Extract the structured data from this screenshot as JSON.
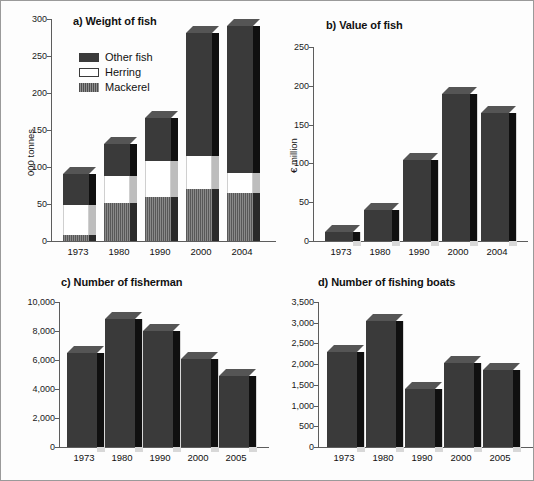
{
  "figure": {
    "background": "#fdfdfd",
    "border_color": "#9a9a9a"
  },
  "legend": {
    "items": [
      {
        "label": "Other fish",
        "swatch": "dark",
        "color": "#3a3a3a"
      },
      {
        "label": "Herring",
        "swatch": "white",
        "color": "#ffffff"
      },
      {
        "label": "Mackerel",
        "swatch": "hatch",
        "color": "#6e6e6e"
      }
    ]
  },
  "panels": {
    "a": {
      "title": "a) Weight of fish",
      "ylabel": "000 tonnes",
      "yticks": [
        "300",
        "250",
        "200",
        "150",
        "100",
        "50",
        "0"
      ],
      "xticks": [
        "1973",
        "1980",
        "1990",
        "2000",
        "2004"
      ]
    },
    "b": {
      "title": "b) Value of fish",
      "ylabel": "€ million",
      "yticks": [
        "250",
        "200",
        "150",
        "100",
        "50",
        "0"
      ],
      "xticks": [
        "1973",
        "1980",
        "1990",
        "2000",
        "2004"
      ]
    },
    "c": {
      "title": "c) Number of fisherman",
      "ylabel": "",
      "yticks": [
        "10,000",
        "8,000",
        "6,000",
        "4,000",
        "2,000",
        "0"
      ],
      "xticks": [
        "1973",
        "1980",
        "1990",
        "2000",
        "2005"
      ]
    },
    "d": {
      "title": "d) Number of fishing boats",
      "ylabel": "",
      "yticks": [
        "3,500",
        "3,000",
        "2,500",
        "2,000",
        "1,500",
        "1,000",
        "500",
        "0"
      ],
      "xticks": [
        "1973",
        "1980",
        "1990",
        "2000",
        "2005"
      ]
    }
  },
  "chart_data": [
    {
      "id": "a",
      "type": "bar",
      "stacked": true,
      "title": "a) Weight of fish",
      "xlabel": "",
      "ylabel": "000 tonnes",
      "ylim": [
        0,
        300
      ],
      "ytick_values": [
        0,
        50,
        100,
        150,
        200,
        250,
        300
      ],
      "grid": false,
      "legend_position": "inside-top-left",
      "categories": [
        "1973",
        "1980",
        "1990",
        "2000",
        "2004"
      ],
      "series": [
        {
          "name": "Mackerel",
          "values": [
            8,
            51,
            60,
            71,
            65
          ],
          "color": "#6e6e6e"
        },
        {
          "name": "Herring",
          "values": [
            40,
            37,
            48,
            44,
            27
          ],
          "color": "#ffffff"
        },
        {
          "name": "Other fish",
          "values": [
            42,
            43,
            58,
            166,
            198
          ],
          "color": "#3a3a3a"
        }
      ],
      "totals": [
        90,
        131,
        166,
        281,
        290
      ]
    },
    {
      "id": "b",
      "type": "bar",
      "stacked": false,
      "title": "b) Value of fish",
      "xlabel": "",
      "ylabel": "€ million",
      "ylim": [
        0,
        250
      ],
      "ytick_values": [
        0,
        50,
        100,
        150,
        200,
        250
      ],
      "grid": false,
      "categories": [
        "1973",
        "1980",
        "1990",
        "2000",
        "2004"
      ],
      "values": [
        12,
        40,
        105,
        190,
        165
      ]
    },
    {
      "id": "c",
      "type": "bar",
      "stacked": false,
      "title": "c) Number of fisherman",
      "xlabel": "",
      "ylabel": "",
      "ylim": [
        0,
        10000
      ],
      "ytick_values": [
        0,
        2000,
        4000,
        6000,
        8000,
        10000
      ],
      "grid": false,
      "categories": [
        "1973",
        "1980",
        "1990",
        "2000",
        "2005"
      ],
      "values": [
        6500,
        8800,
        8000,
        6100,
        4900
      ]
    },
    {
      "id": "d",
      "type": "bar",
      "stacked": false,
      "title": "d) Number of fishing boats",
      "xlabel": "",
      "ylabel": "",
      "ylim": [
        0,
        3500
      ],
      "ytick_values": [
        0,
        500,
        1000,
        1500,
        2000,
        2500,
        3000,
        3500
      ],
      "grid": false,
      "categories": [
        "1973",
        "1980",
        "1990",
        "2000",
        "2005"
      ],
      "values": [
        2300,
        3050,
        1400,
        2030,
        1860
      ]
    }
  ]
}
